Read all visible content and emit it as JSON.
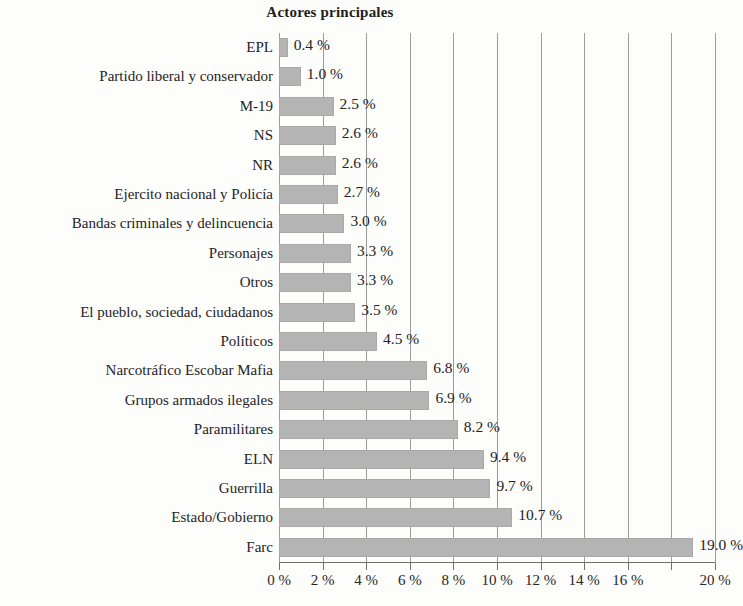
{
  "chart_data": {
    "type": "bar",
    "orientation": "horizontal",
    "title": "Actores principales",
    "xlabel": "",
    "ylabel": "",
    "xlim": [
      0,
      20
    ],
    "grid": true,
    "legend": "none",
    "value_suffix": " %",
    "axis_tick_values": [
      0,
      2,
      4,
      6,
      8,
      10,
      12,
      14,
      16,
      18,
      20
    ],
    "axis_tick_labels": [
      "0 %",
      "2 %",
      "4 %",
      "6 %",
      "8 %",
      "10 %",
      "12 %",
      "14 %",
      "16 %",
      "",
      "20 %"
    ],
    "categories": [
      "EPL",
      "Partido liberal y conservador",
      "M-19",
      "NS",
      "NR",
      "Ejercito nacional y Policía",
      "Bandas criminales y delincuencia",
      "Personajes",
      "Otros",
      "El pueblo, sociedad, ciudadanos",
      "Políticos",
      "Narcotráfico Escobar Mafia",
      "Grupos armados ilegales",
      "Paramilitares",
      "ELN",
      "Guerrilla",
      "Estado/Gobierno",
      "Farc"
    ],
    "values": [
      0.4,
      1.0,
      2.5,
      2.6,
      2.6,
      2.7,
      3.0,
      3.3,
      3.3,
      3.5,
      4.5,
      6.8,
      6.9,
      8.2,
      9.4,
      9.7,
      10.7,
      19.0
    ],
    "data_labels": [
      "0.4 %",
      "1.0 %",
      "2.5 %",
      "2.6 %",
      "2.6 %",
      "2.7 %",
      "3.0 %",
      "3.3 %",
      "3.3 %",
      "3.5 %",
      "4.5 %",
      "6.8 %",
      "6.9 %",
      "8.2 %",
      "9.4 %",
      "9.7 %",
      "10.7 %",
      "19.0 %"
    ],
    "colors": {
      "bar_fill": "#b4b4b4",
      "gridline": "#9b9b9b",
      "axis": "#6f6f6f",
      "text": "#232323",
      "background": "#fdfdfc"
    }
  }
}
